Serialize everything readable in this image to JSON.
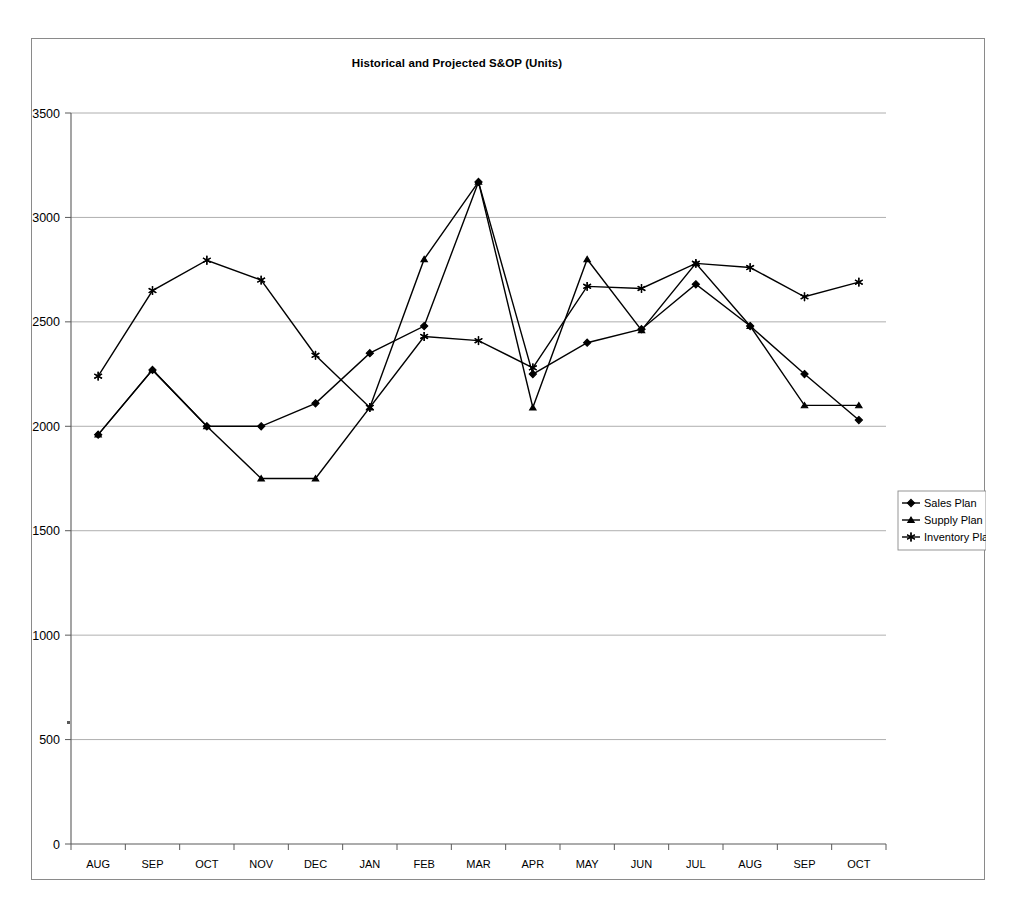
{
  "chart_data": {
    "type": "line",
    "title": "Historical and Projected S&OP (Units)",
    "xlabel": "",
    "ylabel": "",
    "ylim": [
      0,
      3500
    ],
    "ytick_step": 500,
    "yticks": [
      0,
      500,
      1000,
      1500,
      2000,
      2500,
      3000,
      3500
    ],
    "grid": true,
    "legend_position": "right",
    "categories": [
      "AUG",
      "SEP",
      "OCT",
      "NOV",
      "DEC",
      "JAN",
      "FEB",
      "MAR",
      "APR",
      "MAY",
      "JUN",
      "JUL",
      "AUG",
      "SEP",
      "OCT"
    ],
    "series": [
      {
        "name": "Sales Plan",
        "marker": "diamond",
        "values": [
          1960,
          2270,
          2000,
          2000,
          2110,
          2350,
          2480,
          3170,
          2250,
          2400,
          2465,
          2680,
          2480,
          2250,
          2030
        ]
      },
      {
        "name": "Supply Plan",
        "marker": "triangle",
        "values": [
          1960,
          2270,
          2000,
          1750,
          1750,
          2090,
          2800,
          3170,
          2090,
          2800,
          2460,
          2780,
          2480,
          2100,
          2100
        ]
      },
      {
        "name": "Inventory Plan",
        "marker": "asterisk",
        "values": [
          2240,
          2650,
          2795,
          2700,
          2340,
          2090,
          2430,
          2410,
          2280,
          2670,
          2660,
          2780,
          2760,
          2620,
          2690
        ]
      }
    ]
  },
  "legend": {
    "entries": [
      "Sales Plan",
      "Supply Plan",
      "Inventory Plan"
    ]
  },
  "colors": {
    "series_line": "#000000",
    "gridline": "#9a9a9a",
    "axis": "#5a5a5a",
    "frame": "#8a8a8a",
    "background": "#ffffff"
  }
}
